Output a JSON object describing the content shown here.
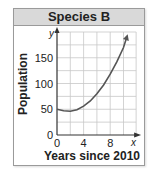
{
  "chart_data": {
    "type": "line",
    "title": "Species B",
    "xlabel": "Years since 2010",
    "ylabel": "Population",
    "x_axis_var": "x",
    "y_axis_var": "y",
    "xlim": [
      0,
      12
    ],
    "ylim": [
      0,
      200
    ],
    "x_ticks": [
      0,
      4,
      8
    ],
    "y_ticks": [
      0,
      50,
      100,
      150
    ],
    "x_tick_labels": [
      "0",
      "4",
      "8"
    ],
    "y_tick_labels": [
      "0",
      "50",
      "100",
      "150"
    ],
    "grid": true,
    "grid_step_x": 2,
    "grid_step_y": 25,
    "series": [
      {
        "name": "Species B population",
        "x": [
          0,
          1,
          2,
          3,
          4,
          5,
          6,
          7,
          8,
          9,
          10,
          10.5
        ],
        "y": [
          50,
          47,
          46,
          49,
          56,
          66,
          80,
          97,
          118,
          142,
          170,
          190
        ],
        "arrow_end": true
      }
    ],
    "legend": "none"
  },
  "header": {
    "title": "Species B"
  },
  "axes": {
    "x_label": "Years since 2010",
    "y_label": "Population",
    "x_var": "x",
    "y_var": "y"
  }
}
